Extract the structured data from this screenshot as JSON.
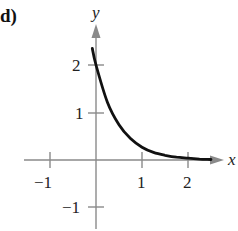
{
  "panel_label": "d)",
  "chart_data": {
    "type": "line",
    "title": "",
    "xlabel": "x",
    "ylabel": "y",
    "xlim": [
      -1.5,
      2.5
    ],
    "ylim": [
      -1.4,
      2.6
    ],
    "grid": false,
    "x_ticks": [
      -1,
      1,
      2
    ],
    "y_ticks": [
      -1,
      1,
      2
    ],
    "x_tick_labels": [
      "−1",
      "1",
      "2"
    ],
    "y_tick_labels": [
      "−1",
      "1",
      "2"
    ],
    "series": [
      {
        "name": "f(x)",
        "x": [
          -0.08,
          0,
          0.25,
          0.5,
          0.75,
          1.0,
          1.25,
          1.5,
          1.75,
          2.0,
          2.25,
          2.5
        ],
        "values": [
          2.35,
          2.0,
          1.21,
          0.74,
          0.45,
          0.27,
          0.16,
          0.1,
          0.06,
          0.04,
          0.02,
          0.01
        ]
      }
    ],
    "colors": {
      "axis": "#888888",
      "curve": "#111111"
    }
  }
}
